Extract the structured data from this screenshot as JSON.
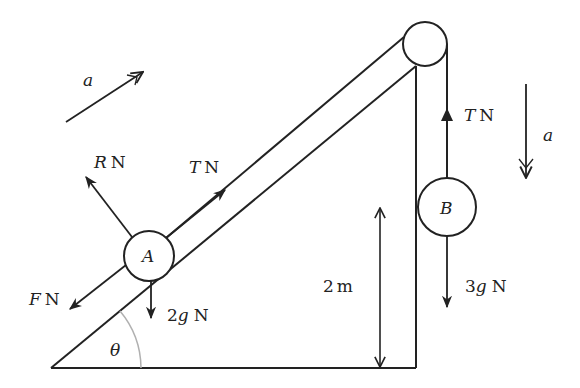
{
  "diagram": {
    "type": "mechanics-free-body",
    "labels": {
      "accel_incline": "a",
      "reaction": "R N",
      "reaction_sym": "R",
      "tension_incline": "T N",
      "tension_sym": "T",
      "friction": "F N",
      "friction_sym": "F",
      "weight_a": "2g N",
      "weight_a_num": "2",
      "weight_a_sym": "g",
      "particle_a": "A",
      "particle_b": "B",
      "tension_vertical": "T N",
      "accel_vertical": "a",
      "height": "2 m",
      "height_num": "2",
      "height_unit": "m",
      "weight_b": "3g N",
      "weight_b_num": "3",
      "weight_b_sym": "g",
      "angle": "θ",
      "unit_N": "N"
    },
    "colors": {
      "stroke": "#222222",
      "angle_arc": "#b0b0b0",
      "background": "#ffffff"
    }
  }
}
